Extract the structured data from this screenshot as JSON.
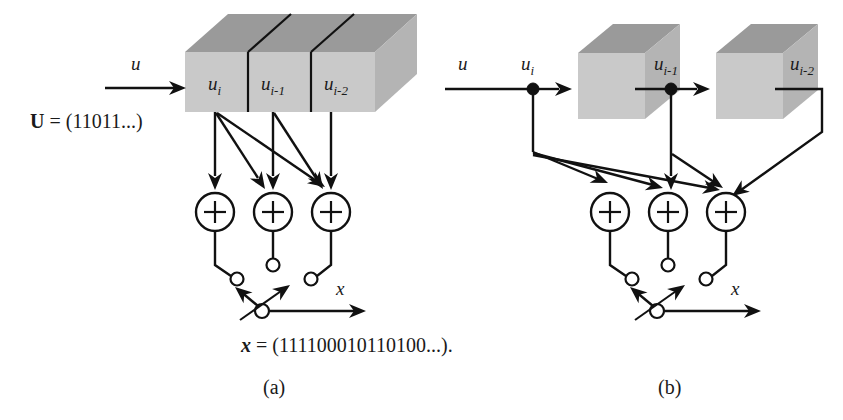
{
  "figure": {
    "caption_a": "(a)",
    "caption_b": "(b)",
    "background_color": "#ffffff",
    "ink_color": "#111111",
    "cube_front_color": "#c9c9c9",
    "cube_top_color": "#9a9a9a"
  },
  "panel_a": {
    "input_label": "u",
    "input_sequence": "U = (11011...)",
    "input_sequence_bold_part": "U",
    "input_sequence_rest": " = (11011...)",
    "register_cells": [
      {
        "base": "u",
        "sub": "i"
      },
      {
        "base": "u",
        "sub": "i-1"
      },
      {
        "base": "u",
        "sub": "i-2"
      }
    ],
    "adders": [
      {
        "symbol": "+"
      },
      {
        "symbol": "+"
      },
      {
        "symbol": "+"
      }
    ],
    "output_label": "x",
    "output_sequence": "x = (111100010110100...).",
    "output_sequence_bold_part": "x",
    "output_sequence_rest": " = (111100010110100...)."
  },
  "panel_b": {
    "input_label": "u",
    "tap_labels": [
      {
        "base": "u",
        "sub": "i"
      },
      {
        "base": "u",
        "sub": "i-1"
      },
      {
        "base": "u",
        "sub": "i-2"
      }
    ],
    "adders": [
      {
        "symbol": "+"
      },
      {
        "symbol": "+"
      },
      {
        "symbol": "+"
      }
    ],
    "output_label": "x"
  }
}
